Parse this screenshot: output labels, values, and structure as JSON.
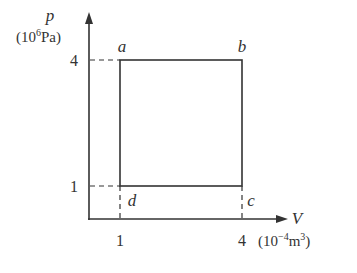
{
  "diagram": {
    "type": "p-V cycle diagram",
    "y_axis": {
      "variable": "p",
      "unit": "(10",
      "unit_exp": "6",
      "unit_tail": "Pa)",
      "ticks": [
        "4",
        "1"
      ]
    },
    "x_axis": {
      "variable": "V",
      "unit": "(10",
      "unit_exp": "−4",
      "unit_mid": "m",
      "unit_exp2": "3",
      "unit_tail": ")",
      "ticks": [
        "1",
        "4"
      ]
    },
    "points": [
      {
        "label": "a",
        "V": 1,
        "p": 4
      },
      {
        "label": "b",
        "V": 4,
        "p": 4
      },
      {
        "label": "c",
        "V": 4,
        "p": 1
      },
      {
        "label": "d",
        "V": 1,
        "p": 1
      }
    ],
    "colors": {
      "line": "#333333",
      "background": "#ffffff"
    }
  }
}
